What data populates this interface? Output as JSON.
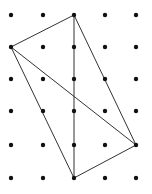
{
  "diagram": {
    "type": "geoboard-dot-grid",
    "background": "#ffffff",
    "dot_color": "#111111",
    "line_color": "#333333",
    "grid": {
      "columns": 5,
      "rows": 6,
      "x_positions": [
        11,
        43,
        74,
        105,
        136
      ],
      "y_positions": [
        15,
        47,
        79,
        111,
        145,
        178
      ],
      "dot_radius": 2.2
    },
    "vertices": {
      "A": [
        2,
        0
      ],
      "B": [
        0,
        1
      ],
      "C": [
        4,
        4
      ],
      "D": [
        2,
        5
      ]
    },
    "segments": [
      [
        "A",
        "B"
      ],
      [
        "A",
        "D"
      ],
      [
        "A",
        "C"
      ],
      [
        "B",
        "C"
      ],
      [
        "B",
        "D"
      ],
      [
        "D",
        "C"
      ]
    ]
  }
}
